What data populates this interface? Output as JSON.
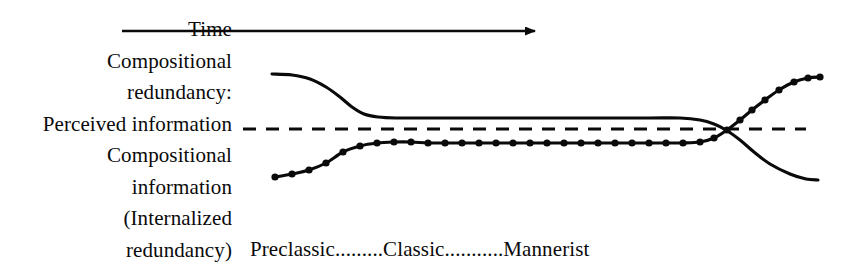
{
  "figure": {
    "title_axis_arrow_label": "Time",
    "left_labels": [
      "Compositional",
      "redundancy:",
      "Perceived information",
      "Compositional",
      "information",
      "(Internalized",
      "redundancy)"
    ],
    "bottom_axis_label": "Preclassic.........Classic...........Mannerist",
    "bottom_axis_stages": [
      "Preclassic",
      "Classic",
      "Mannerist"
    ],
    "colors": {
      "ink": "#0a0a0a",
      "background": "#ffffff"
    }
  },
  "chart_data": {
    "type": "line",
    "title": "",
    "xlabel": "Time",
    "ylabel": "",
    "annotations": [
      "Time",
      "Compositional redundancy:",
      "Perceived information",
      "Compositional information (Internalized redundancy)"
    ],
    "axis_tick_labels": [
      "Preclassic",
      "Classic",
      "Mannerist"
    ],
    "reference_line": {
      "name": "Perceived information",
      "style": "dashed",
      "y_pixel": 129,
      "x_start_pixel": 243,
      "x_end_pixel": 806
    },
    "time_arrow": {
      "x_start_pixel": 122,
      "x_end_pixel": 541,
      "y_pixel": 31,
      "direction": "right"
    },
    "grid": false,
    "legend": "none",
    "series": [
      {
        "name": "Compositional redundancy",
        "style": "solid",
        "markers": false,
        "points": [
          [
            272,
            74
          ],
          [
            292,
            75
          ],
          [
            310,
            79
          ],
          [
            326,
            87
          ],
          [
            340,
            97
          ],
          [
            352,
            107
          ],
          [
            364,
            114
          ],
          [
            378,
            117
          ],
          [
            396,
            118
          ],
          [
            430,
            118
          ],
          [
            480,
            118
          ],
          [
            540,
            118
          ],
          [
            600,
            118
          ],
          [
            650,
            118
          ],
          [
            680,
            118
          ],
          [
            700,
            120
          ],
          [
            714,
            124
          ],
          [
            726,
            130
          ],
          [
            740,
            140
          ],
          [
            754,
            152
          ],
          [
            770,
            164
          ],
          [
            790,
            174
          ],
          [
            806,
            179
          ],
          [
            818,
            180
          ]
        ]
      },
      {
        "name": "Compositional information (Internalized redundancy)",
        "style": "solid",
        "markers": true,
        "marker_shape": "filled-circle",
        "points": [
          [
            275,
            177
          ],
          [
            292,
            174
          ],
          [
            309,
            170
          ],
          [
            326,
            163
          ],
          [
            343,
            152
          ],
          [
            360,
            146
          ],
          [
            377,
            143
          ],
          [
            394,
            142
          ],
          [
            411,
            142
          ],
          [
            428,
            143
          ],
          [
            445,
            143
          ],
          [
            462,
            143
          ],
          [
            479,
            143
          ],
          [
            496,
            143
          ],
          [
            513,
            143
          ],
          [
            530,
            143
          ],
          [
            547,
            143
          ],
          [
            564,
            143
          ],
          [
            581,
            143
          ],
          [
            598,
            143
          ],
          [
            615,
            143
          ],
          [
            632,
            143
          ],
          [
            649,
            143
          ],
          [
            666,
            143
          ],
          [
            683,
            143
          ],
          [
            700,
            142
          ],
          [
            714,
            138
          ],
          [
            727,
            130
          ],
          [
            740,
            120
          ],
          [
            752,
            110
          ],
          [
            765,
            100
          ],
          [
            779,
            90
          ],
          [
            794,
            82
          ],
          [
            808,
            78
          ],
          [
            820,
            77
          ]
        ]
      }
    ],
    "crossing_point_pixel": [
      730,
      129
    ]
  }
}
